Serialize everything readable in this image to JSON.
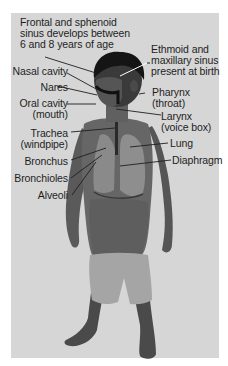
{
  "diagram": {
    "type": "anatomical-labeled-photo",
    "colors": {
      "background": "#ffffff",
      "panel": "#d6d6d6",
      "text": "#1e1e1e",
      "leader_line": "#1e1e1e",
      "highlight_line": "#ffffff"
    },
    "labels": {
      "frontal": {
        "line1": "Frontal and sphenoid",
        "line2": "sinus develops between",
        "line3": "6 and 8 years of age"
      },
      "ethmoid": {
        "line1": "Ethmoid and",
        "line2": "maxillary sinus",
        "line3": "present at birth"
      },
      "nasal_cavity": {
        "line1": "Nasal cavity"
      },
      "nares": {
        "line1": "Nares"
      },
      "oral_cavity": {
        "line1": "Oral cavity",
        "line2": "(mouth)"
      },
      "pharynx": {
        "line1": "Pharynx",
        "line2": "(throat)"
      },
      "larynx": {
        "line1": "Larynx",
        "line2": "(voice box)"
      },
      "trachea": {
        "line1": "Trachea",
        "line2": "(windpipe)"
      },
      "lung": {
        "line1": "Lung"
      },
      "bronchus": {
        "line1": "Bronchus"
      },
      "diaphragm": {
        "line1": "Diaphragm"
      },
      "bronchioles": {
        "line1": "Bronchioles"
      },
      "alveoli": {
        "line1": "Alveoli"
      }
    }
  }
}
